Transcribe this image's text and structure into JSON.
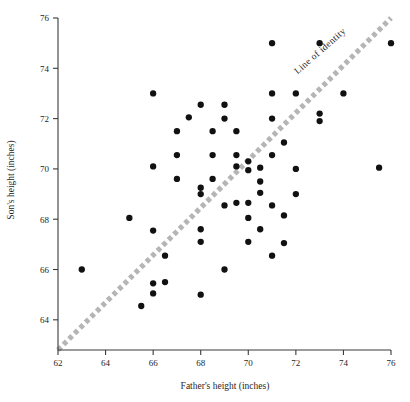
{
  "chart_data": {
    "type": "scatter",
    "title": "",
    "xlabel": "Father's height (inches)",
    "ylabel": "Son's height (inches)",
    "xlim": [
      62,
      76
    ],
    "ylim": [
      62.8,
      76
    ],
    "xticks": [
      62,
      64,
      66,
      68,
      70,
      72,
      74,
      76
    ],
    "yticks": [
      64,
      66,
      68,
      70,
      72,
      74,
      76
    ],
    "xticklabels": [
      "62",
      "64",
      "66",
      "68",
      "70",
      "72",
      "74",
      "76"
    ],
    "yticklabels": [
      "64",
      "66",
      "68",
      "70",
      "72",
      "74",
      "76"
    ],
    "grid": false,
    "legend": "none",
    "annotations": [
      {
        "text": "Line of identity",
        "x": 73.1,
        "y": 74.6,
        "rotation": -41
      }
    ],
    "reference_line": {
      "name": "Line of identity",
      "type": "y=x",
      "style": "dotted",
      "color": "#b5b5b5",
      "from": [
        62,
        62.8
      ],
      "to": [
        76,
        76
      ]
    },
    "series": [
      {
        "name": "Father-son heights",
        "marker": "filled-circle",
        "color": "#111111",
        "points": [
          [
            63.0,
            66.0
          ],
          [
            65.0,
            68.05
          ],
          [
            65.5,
            64.55
          ],
          [
            66.0,
            67.55
          ],
          [
            66.0,
            70.1
          ],
          [
            66.0,
            73.0
          ],
          [
            66.0,
            65.45
          ],
          [
            66.0,
            65.05
          ],
          [
            66.5,
            65.5
          ],
          [
            66.5,
            66.55
          ],
          [
            67.0,
            71.5
          ],
          [
            67.0,
            69.6
          ],
          [
            67.0,
            70.55
          ],
          [
            67.5,
            72.05
          ],
          [
            68.0,
            69.25
          ],
          [
            68.0,
            69.0
          ],
          [
            68.0,
            67.6
          ],
          [
            68.0,
            67.1
          ],
          [
            68.0,
            72.55
          ],
          [
            68.0,
            65.0
          ],
          [
            68.5,
            71.5
          ],
          [
            68.5,
            70.55
          ],
          [
            68.5,
            69.6
          ],
          [
            69.0,
            72.55
          ],
          [
            69.0,
            72.0
          ],
          [
            69.0,
            68.55
          ],
          [
            69.0,
            66.0
          ],
          [
            69.5,
            71.5
          ],
          [
            69.5,
            70.55
          ],
          [
            69.5,
            70.1
          ],
          [
            69.5,
            68.65
          ],
          [
            70.0,
            70.3
          ],
          [
            70.0,
            69.95
          ],
          [
            70.0,
            68.65
          ],
          [
            70.0,
            68.05
          ],
          [
            70.0,
            67.1
          ],
          [
            70.5,
            70.05
          ],
          [
            70.5,
            69.5
          ],
          [
            70.5,
            69.05
          ],
          [
            70.5,
            67.6
          ],
          [
            71.0,
            75.0
          ],
          [
            71.0,
            73.0
          ],
          [
            71.0,
            72.0
          ],
          [
            71.0,
            70.55
          ],
          [
            71.0,
            68.55
          ],
          [
            71.0,
            66.55
          ],
          [
            71.5,
            71.05
          ],
          [
            71.5,
            68.15
          ],
          [
            71.5,
            67.05
          ],
          [
            72.0,
            73.0
          ],
          [
            72.0,
            70.0
          ],
          [
            72.0,
            69.0
          ],
          [
            73.0,
            75.0
          ],
          [
            73.0,
            72.2
          ],
          [
            73.0,
            71.9
          ],
          [
            74.0,
            73.0
          ],
          [
            75.5,
            70.05
          ],
          [
            76.0,
            75.0
          ]
        ]
      }
    ]
  }
}
